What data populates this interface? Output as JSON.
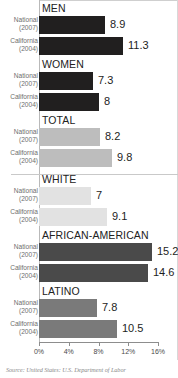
{
  "chart_data": {
    "type": "bar",
    "orientation": "horizontal",
    "title": "",
    "xlabel": "",
    "ylabel": "",
    "xlim": [
      0,
      16
    ],
    "xticks": [
      0,
      4,
      8,
      12,
      16
    ],
    "xtick_labels": [
      "0%",
      "4%",
      "8%",
      "12%",
      "16%"
    ],
    "grid": false,
    "legend": "none",
    "series_labels": [
      "National (2007)",
      "California (2004)"
    ],
    "sections": [
      {
        "label": "MEN",
        "color": "#211f1f",
        "bars": [
          {
            "category": "National",
            "year": "(2007)",
            "value": 8.9
          },
          {
            "category": "California",
            "year": "(2004)",
            "value": 11.3
          }
        ]
      },
      {
        "label": "WOMEN",
        "color": "#211f1f",
        "bars": [
          {
            "category": "National",
            "year": "(2007)",
            "value": 7.3
          },
          {
            "category": "California",
            "year": "(2004)",
            "value": 8
          }
        ]
      },
      {
        "label": "TOTAL",
        "color": "#bdbdbd",
        "bars": [
          {
            "category": "National",
            "year": "(2007)",
            "value": 8.2
          },
          {
            "category": "California",
            "year": "(2004)",
            "value": 9.8
          }
        ]
      },
      {
        "label": "WHITE",
        "color": "#e2e2e2",
        "bars": [
          {
            "category": "National",
            "year": "(2007)",
            "value": 7
          },
          {
            "category": "California",
            "year": "(2004)",
            "value": 9.1
          }
        ]
      },
      {
        "label": "AFRICAN-AMERICAN",
        "color": "#4a4a4a",
        "bars": [
          {
            "category": "National",
            "year": "(2007)",
            "value": 15.2
          },
          {
            "category": "California",
            "year": "(2004)",
            "value": 14.6
          }
        ]
      },
      {
        "label": "LATINO",
        "color": "#7a7a7a",
        "bars": [
          {
            "category": "National",
            "year": "(2007)",
            "value": 7.8
          },
          {
            "category": "California",
            "year": "(2004)",
            "value": 10.5
          }
        ]
      }
    ]
  },
  "footer": {
    "source": "Source: United States: U.S. Department of Labor"
  }
}
